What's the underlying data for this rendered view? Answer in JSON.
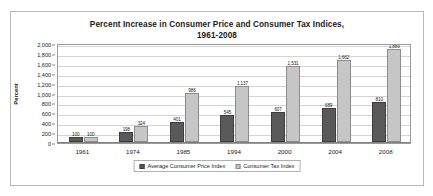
{
  "chart_data": {
    "type": "bar",
    "title": "Percent Increase in Consumer Price and Consumer Tax Indices, 1961-2008",
    "title_lines": [
      "Percent Increase in Consumer Price and Consumer Tax Indices,",
      "1961-2008"
    ],
    "xlabel": "",
    "ylabel": "Percent",
    "ylim": [
      0,
      2000
    ],
    "ytick_step": 200,
    "yticks": [
      "2,000",
      "1,800",
      "1,600",
      "1,400",
      "1,200",
      "1,000",
      "800",
      "600",
      "400",
      "200",
      "0"
    ],
    "ytick_values": [
      2000,
      1800,
      1600,
      1400,
      1200,
      1000,
      800,
      600,
      400,
      200,
      0
    ],
    "grid": true,
    "legend_position": "bottom-center",
    "categories": [
      "1961",
      "1974",
      "1985",
      "1994",
      "2000",
      "2004",
      "2008"
    ],
    "series": [
      {
        "name": "Average Consumer Price Index",
        "color": "#595959",
        "values": [
          100,
          198,
          401,
          545,
          607,
          689,
          810
        ],
        "labels": [
          "100",
          "198",
          "401",
          "545",
          "607",
          "689",
          "810"
        ]
      },
      {
        "name": "Consumer Tax Index",
        "color": "#c6c6c6",
        "values": [
          100,
          324,
          986,
          1137,
          1531,
          1662,
          1889
        ],
        "labels": [
          "100",
          "324",
          "986",
          "1,137",
          "1,531",
          "1,662",
          "1,889"
        ]
      }
    ]
  },
  "colors": {
    "cpi": "#595959",
    "ctax": "#c6c6c6",
    "grid": "#d4d4d4",
    "axis": "#9a9a9a",
    "frame": "#b9b9b9",
    "background": "#ffffff"
  }
}
